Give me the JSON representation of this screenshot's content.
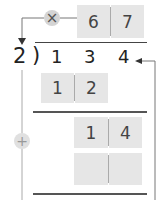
{
  "quotient_row": {
    "operator_symbol": "×",
    "boxes": [
      "6",
      "7"
    ]
  },
  "division": {
    "divisor": "2",
    "bracket": ")",
    "dividend_digits": [
      "1",
      "3",
      "4"
    ]
  },
  "step1_product": {
    "boxes": [
      "1",
      "2"
    ]
  },
  "step2_remainder": {
    "boxes": [
      "1",
      "4"
    ]
  },
  "step3_product": {
    "boxes": [
      "",
      ""
    ]
  },
  "side_operator": {
    "symbol": "+"
  },
  "colors": {
    "box_bg": "#e6e6e6",
    "circle_bg": "#d4d4d4",
    "line": "#555555",
    "arrow": "#777777"
  }
}
